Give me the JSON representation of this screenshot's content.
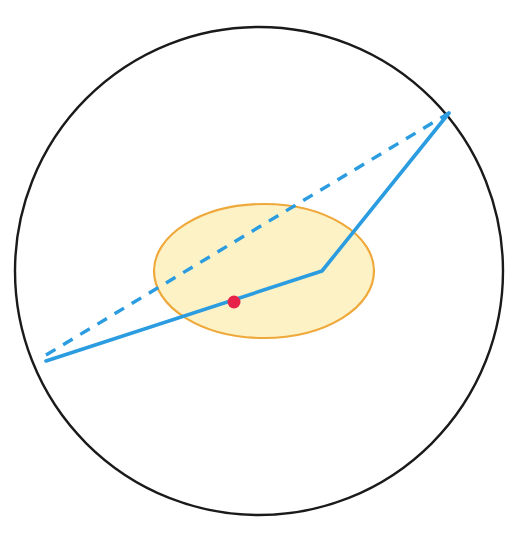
{
  "figure": {
    "type": "geometric-diagram",
    "canvas": {
      "width": 522,
      "height": 536,
      "background": "#ffffff"
    },
    "caption": ""
  },
  "colors": {
    "boundary_circle_stroke": "#1a1a1a",
    "ellipse_stroke": "#efa83a",
    "ellipse_fill": "#fdf2c6",
    "path_blue": "#2b9ce0",
    "dashed_blue": "#2b9ce0",
    "point_red": "#e8234a"
  },
  "shapes": {
    "boundary_circle": {
      "label": "boundary-circle",
      "cx": 259,
      "cy": 271,
      "r": 244,
      "stroke_width": 2.4,
      "fill": "none"
    },
    "inner_ellipse": {
      "label": "inner-ellipse",
      "cx": 264,
      "cy": 271,
      "rx": 110,
      "ry": 67,
      "rotation_deg": 0,
      "stroke_width": 2.2
    },
    "marked_point": {
      "label": "marked-point",
      "cx": 234,
      "cy": 302,
      "r": 6.5
    },
    "solid_path": {
      "label": "refracted-path",
      "points": [
        {
          "x": 46,
          "y": 361
        },
        {
          "x": 322,
          "y": 271
        },
        {
          "x": 449,
          "y": 113
        }
      ],
      "stroke_width": 3.6
    },
    "dashed_path": {
      "label": "straight-chord",
      "points": [
        {
          "x": 46,
          "y": 355
        },
        {
          "x": 449,
          "y": 113
        }
      ],
      "stroke_width": 3.4,
      "dash_pattern": "11 9"
    }
  },
  "chart_data": {
    "type": "scatter",
    "xlabel": "",
    "ylabel": "",
    "xlim": [
      0,
      522
    ],
    "ylim": [
      536,
      0
    ],
    "grid": false,
    "legend": "none",
    "series": [
      {
        "name": "boundary circle",
        "kind": "circle",
        "center": [
          259,
          271
        ],
        "radius": 244,
        "stroke": "#1a1a1a",
        "fill": "none"
      },
      {
        "name": "inner ellipse region",
        "kind": "ellipse",
        "center": [
          264,
          271
        ],
        "semi_axes": [
          110,
          67
        ],
        "stroke": "#efa83a",
        "fill": "#fdf2c6"
      },
      {
        "name": "refracted path (solid)",
        "kind": "polyline",
        "x": [
          46,
          322,
          449
        ],
        "y": [
          361,
          271,
          113
        ],
        "stroke": "#2b9ce0",
        "style": "solid"
      },
      {
        "name": "straight chord (dashed)",
        "kind": "line",
        "x": [
          46,
          449
        ],
        "y": [
          355,
          113
        ],
        "stroke": "#2b9ce0",
        "style": "dashed"
      },
      {
        "name": "marked point",
        "kind": "point",
        "x": [
          234
        ],
        "y": [
          302
        ],
        "color": "#e8234a",
        "marker_size": 13
      }
    ]
  }
}
